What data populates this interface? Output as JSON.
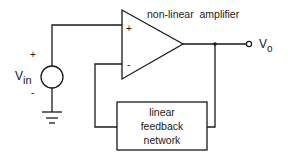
{
  "diagram": {
    "amplifier": {
      "label": "non-linear  amplifier",
      "plus_sign": "+",
      "minus_sign": "-"
    },
    "source": {
      "label_main": "V",
      "label_sub": "in",
      "plus_sign": "+",
      "minus_sign": "-"
    },
    "output": {
      "label_main": "V",
      "label_sub": "o"
    },
    "feedback_box": {
      "line1": "linear",
      "line2": "feedback",
      "line3": "network"
    },
    "colors": {
      "stroke": "#1a1a1a",
      "background": "#ffffff"
    }
  }
}
